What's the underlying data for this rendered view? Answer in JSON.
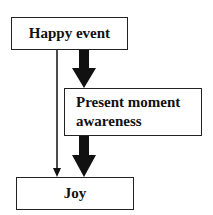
{
  "diagram": {
    "nodes": [
      {
        "id": "happy_event",
        "label": "Happy event"
      },
      {
        "id": "present_moment_awareness",
        "label_line1": "Present moment",
        "label_line2": "awareness"
      },
      {
        "id": "joy",
        "label": "Joy"
      }
    ],
    "edges": [
      {
        "from": "happy_event",
        "to": "joy",
        "style": "thin"
      },
      {
        "from": "happy_event",
        "to": "present_moment_awareness",
        "style": "thick"
      },
      {
        "from": "present_moment_awareness",
        "to": "joy",
        "style": "thick"
      }
    ]
  }
}
